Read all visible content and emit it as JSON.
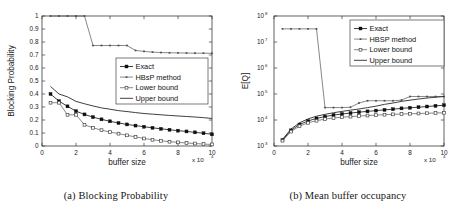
{
  "figure": {
    "panels": [
      {
        "caption": "(a) Blocking Probability",
        "chart_ref": 0
      },
      {
        "caption": "(b) Mean buffer occupancy",
        "chart_ref": 1
      }
    ]
  },
  "chart_data": [
    {
      "type": "line",
      "title": "",
      "xlabel": "buffer size",
      "ylabel": "Blocking Probability",
      "x_multiplier": "x 10",
      "x_multiplier_exp": "4",
      "xlim": [
        0,
        10
      ],
      "ylim": [
        0,
        1
      ],
      "xticks": [
        "0",
        "2",
        "4",
        "6",
        "8",
        "10"
      ],
      "yticks": [
        "0",
        "0.1",
        "0.2",
        "0.3",
        "0.4",
        "0.5",
        "0.6",
        "0.7",
        "0.8",
        "0.9",
        "1"
      ],
      "grid": false,
      "legend_position": "center-right",
      "x": [
        0.5,
        1.0,
        1.5,
        2.0,
        2.5,
        3.0,
        3.5,
        4.0,
        4.5,
        5.0,
        5.5,
        6.0,
        6.5,
        7.0,
        7.5,
        8.0,
        8.5,
        9.0,
        9.5,
        10.0
      ],
      "series": [
        {
          "name": "Exact",
          "marker": "filled-square",
          "values": [
            0.4,
            0.345,
            0.305,
            0.268,
            0.243,
            0.222,
            0.205,
            0.19,
            0.177,
            0.166,
            0.157,
            0.148,
            0.14,
            0.132,
            0.125,
            0.118,
            0.112,
            0.105,
            0.098,
            0.09
          ]
        },
        {
          "name": "HBsP method",
          "marker": "small-dot",
          "values": [
            1.0,
            1.0,
            1.0,
            1.0,
            1.0,
            0.773,
            0.773,
            0.773,
            0.773,
            0.773,
            0.735,
            0.728,
            0.722,
            0.719,
            0.717,
            0.716,
            0.715,
            0.714,
            0.714,
            0.713
          ]
        },
        {
          "name": "Lower bound",
          "marker": "open-square",
          "values": [
            0.333,
            0.333,
            0.24,
            0.24,
            0.163,
            0.14,
            0.122,
            0.107,
            0.095,
            0.082,
            0.07,
            0.058,
            0.048,
            0.04,
            0.033,
            0.028,
            0.023,
            0.019,
            0.015,
            0.012
          ]
        },
        {
          "name": "Upper bound",
          "marker": "none",
          "values": [
            0.458,
            0.4,
            0.378,
            0.343,
            0.325,
            0.308,
            0.293,
            0.283,
            0.272,
            0.265,
            0.257,
            0.25,
            0.245,
            0.24,
            0.235,
            0.231,
            0.227,
            0.223,
            0.218,
            0.212
          ]
        }
      ]
    },
    {
      "type": "line",
      "title": "",
      "xlabel": "buffer size",
      "ylabel": "E[Q]",
      "x_multiplier": "x 10",
      "x_multiplier_exp": "4",
      "xlim": [
        0,
        10
      ],
      "ylim": [
        1000,
        100000000
      ],
      "yscale": "log",
      "xticks": [
        "0",
        "2",
        "4",
        "6",
        "8",
        "10"
      ],
      "yticks": [
        "10",
        "10",
        "10",
        "10",
        "10",
        "10"
      ],
      "yticks_exp": [
        "3",
        "4",
        "5",
        "6",
        "7",
        "8"
      ],
      "grid": false,
      "legend_position": "top-right",
      "x": [
        0.5,
        1.0,
        1.5,
        2.0,
        2.5,
        3.0,
        3.5,
        4.0,
        4.5,
        5.0,
        5.5,
        6.0,
        6.5,
        7.0,
        7.5,
        8.0,
        8.5,
        9.0,
        9.5,
        10.0
      ],
      "series": [
        {
          "name": "Exact",
          "marker": "filled-square",
          "values": [
            1700,
            4000,
            6700,
            9200,
            11500,
            13500,
            15500,
            17000,
            18500,
            20000,
            21500,
            23000,
            24500,
            26000,
            28000,
            29500,
            31000,
            33000,
            35000,
            37000
          ]
        },
        {
          "name": "HBSP method",
          "marker": "small-dot",
          "values": [
            32000000,
            32000000,
            32000000,
            32000000,
            32000000,
            30000,
            30000,
            30000,
            31000,
            45000,
            55000,
            55000,
            55000,
            55000,
            58000,
            80000,
            80000,
            80000,
            80000,
            80000
          ]
        },
        {
          "name": "Lower bound",
          "marker": "open-square",
          "values": [
            1600,
            3600,
            5800,
            7800,
            9400,
            10800,
            12000,
            12800,
            13500,
            14200,
            14800,
            15400,
            16000,
            16500,
            17000,
            17400,
            17800,
            18200,
            18600,
            19000
          ]
        },
        {
          "name": "Upper bound",
          "marker": "none",
          "values": [
            1800,
            4500,
            7800,
            11000,
            14000,
            16500,
            19000,
            21500,
            24000,
            26500,
            30000,
            34000,
            40000,
            45000,
            52000,
            58000,
            64000,
            70000,
            75000,
            80000
          ]
        }
      ]
    }
  ]
}
